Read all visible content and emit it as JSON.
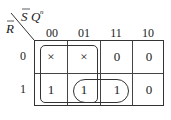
{
  "kmap": {
    "corner_labels": {
      "row_var": "R",
      "col_vars_1": "S",
      "col_vars_2": "Q",
      "col_superscript": "n"
    },
    "col_headers": [
      "00",
      "01",
      "11",
      "10"
    ],
    "row_headers": [
      "0",
      "1"
    ],
    "cells": [
      [
        "×",
        "×",
        "0",
        "0"
      ],
      [
        "1",
        "1",
        "1",
        "0"
      ]
    ],
    "groups": [
      {
        "name": "group-cols-00-01",
        "cells": "rows 0-1, cols 00-01"
      },
      {
        "name": "group-row1-01-11",
        "cells": "row 1, cols 01-11"
      }
    ]
  }
}
